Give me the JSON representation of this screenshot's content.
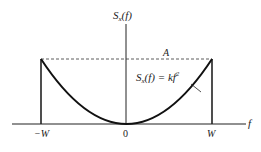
{
  "figure": {
    "y_axis_label": {
      "main": "S",
      "sub": "x",
      "arg": "(f)"
    },
    "x_axis_label": "f",
    "level_label": "A",
    "curve_label": {
      "main": "S",
      "sub": "x",
      "arg": "(f) = kf",
      "sup": "2"
    },
    "ticks": {
      "left": "−W",
      "center": "0",
      "right": "W"
    },
    "caption": ""
  },
  "colors": {
    "ink": "#222222",
    "background": "#ffffff"
  }
}
